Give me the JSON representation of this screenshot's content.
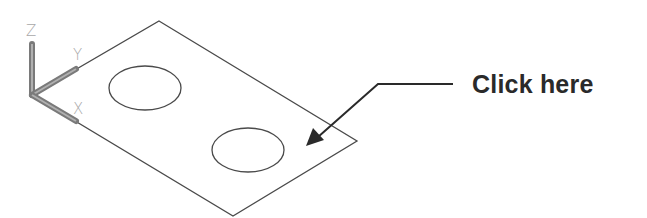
{
  "ucs_icon": {
    "labels": {
      "z": "Z",
      "y": "Y",
      "x": "X"
    },
    "color": "#8a8a8a"
  },
  "drawing": {
    "plate": {
      "shape": "isometric-rectangle",
      "stroke": "#4a4a4a"
    },
    "holes": [
      {
        "name": "hole-1",
        "shape": "ellipse"
      },
      {
        "name": "hole-2",
        "shape": "ellipse"
      }
    ]
  },
  "callout": {
    "label": "Click here",
    "color": "#2a2a2a"
  }
}
